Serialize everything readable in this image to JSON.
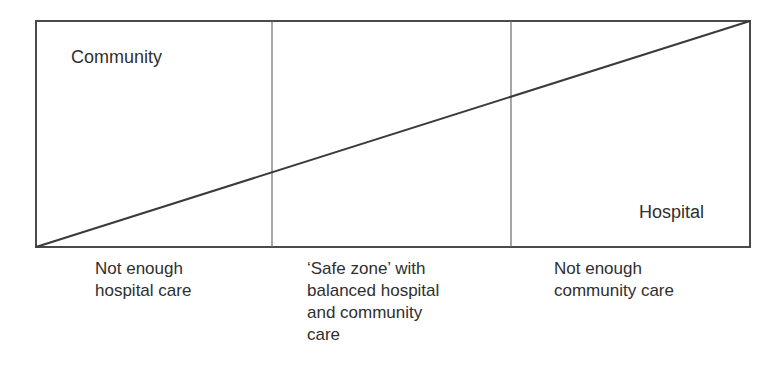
{
  "diagram": {
    "type": "balance-diagram",
    "box": {
      "left": 36,
      "top": 21,
      "right": 750,
      "bottom": 247
    },
    "dividers_x": [
      272,
      511
    ],
    "diagonal": {
      "from": [
        36,
        247
      ],
      "to": [
        750,
        21
      ]
    },
    "colors": {
      "border": "#4a4a4a",
      "divider": "#6a6a6a",
      "diagonal": "#3a3a3a",
      "text": "#2f2f2f"
    },
    "region_labels": {
      "top_left": "Community",
      "bottom_right": "Hospital"
    },
    "zones": [
      {
        "id": "left",
        "lines": [
          "Not enough",
          "hospital care"
        ]
      },
      {
        "id": "middle",
        "lines": [
          "‘Safe zone’ with",
          "balanced hospital",
          "and community",
          "care"
        ]
      },
      {
        "id": "right",
        "lines": [
          "Not enough",
          "community care"
        ]
      }
    ]
  }
}
